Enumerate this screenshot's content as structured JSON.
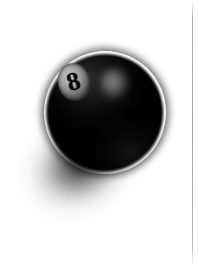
{
  "scene": {
    "title": "Black billiard eight ball on white background",
    "width": 198,
    "height": 268,
    "background_color": "#ffffff"
  },
  "ball": {
    "name": "eight-ball",
    "number": "8",
    "body_color": "#000000",
    "disc_color": "#b4b4b4",
    "number_color": "#080808",
    "highlight_color": "#767676"
  },
  "shadow": {
    "name": "cast-shadow",
    "color": "#3c3c3c",
    "direction": "lower-left"
  },
  "page_edge": {
    "name": "page-edge-rule",
    "color": "#a8a8a8"
  }
}
